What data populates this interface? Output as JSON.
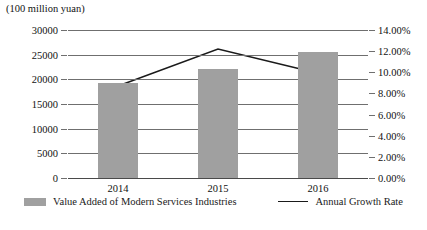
{
  "chart_data": {
    "type": "bar",
    "title": "",
    "subtitle": "",
    "unit_caption": "(100 million yuan)",
    "categories": [
      "2014",
      "2015",
      "2016"
    ],
    "xlabel": "",
    "ylabel": "",
    "grid": true,
    "legend_position": "bottom",
    "axes": {
      "left": {
        "label": "(100 million yuan)",
        "ticks": [
          "0",
          "5000",
          "10000",
          "15000",
          "20000",
          "25000",
          "30000"
        ],
        "tick_values": [
          0,
          5000,
          10000,
          15000,
          20000,
          25000,
          30000
        ],
        "min": 0,
        "max": 30000,
        "step": 5000
      },
      "right": {
        "label": "",
        "ticks": [
          "0.00%",
          "2.00%",
          "4.00%",
          "6.00%",
          "8.00%",
          "10.00%",
          "12.00%",
          "14.00%"
        ],
        "tick_values": [
          0,
          2,
          4,
          6,
          8,
          10,
          12,
          14
        ],
        "min": 0,
        "max": 14,
        "step": 2
      }
    },
    "series": [
      {
        "name": "Value Added of Modern Services Industries",
        "type": "bar",
        "axis": "left",
        "color": "#a0a0a0",
        "values": [
          19300,
          22000,
          25500
        ]
      },
      {
        "name": "Annual Growth Rate",
        "type": "line",
        "axis": "right",
        "color": "#1a1a1a",
        "values": [
          8.7,
          12.2,
          9.9
        ]
      }
    ]
  },
  "legend": {
    "items": [
      {
        "label": "Value Added of Modern Services Industries",
        "marker": "bar-swatch",
        "color": "#a0a0a0"
      },
      {
        "label": "Annual Growth Rate",
        "marker": "line-swatch",
        "color": "#1a1a1a"
      }
    ]
  }
}
